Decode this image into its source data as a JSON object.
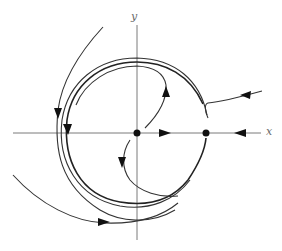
{
  "figure": {
    "type": "phase portrait",
    "axes": {
      "x_label": "x",
      "y_label": "y"
    },
    "fixed_points": [
      {
        "name": "origin",
        "x": 0,
        "y": 0
      },
      {
        "name": "saddle-right",
        "x": 1,
        "y": 0
      }
    ],
    "x_axis_flow": [
      {
        "segment": "between origin and right fixed point",
        "direction": "right"
      },
      {
        "segment": "right of right fixed point",
        "direction": "left"
      }
    ],
    "colors": {
      "axis": "#7a7a7a",
      "trajectory": "#333333",
      "marker": "#111111",
      "background": "#ffffff"
    }
  }
}
